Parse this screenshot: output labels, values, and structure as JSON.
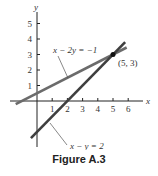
{
  "figure": {
    "caption": "Figure A.3"
  },
  "chart_data": {
    "type": "line",
    "title": "",
    "xlabel": "x",
    "ylabel": "y",
    "xlim": [
      -1.5,
      6.5
    ],
    "ylim": [
      -2.6,
      6
    ],
    "x_ticks": [
      1,
      2,
      3,
      4,
      5,
      6
    ],
    "y_ticks": [
      1,
      2,
      3,
      4,
      5
    ],
    "grid": false,
    "series": [
      {
        "name": "x - 2y = -1",
        "label": "x − 2y = −1",
        "x": [
          -1.4,
          5.9
        ],
        "y": [
          -0.2,
          3.45
        ],
        "color": "#6b6b6b"
      },
      {
        "name": "x - y = 2",
        "label": "x − y = 2",
        "x": [
          -0.4,
          5.8
        ],
        "y": [
          -2.4,
          3.8
        ],
        "color": "#3f3f3f"
      }
    ],
    "annotations": [
      {
        "text": "(5, 3)",
        "x": 5,
        "y": 3,
        "type": "intersection-point"
      }
    ]
  }
}
